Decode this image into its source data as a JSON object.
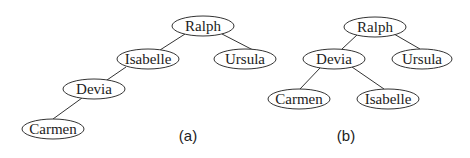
{
  "figure": {
    "trees": [
      {
        "caption": "(a)",
        "nodes": [
          {
            "id": "ralph",
            "label": "Ralph"
          },
          {
            "id": "isabelle",
            "label": "Isabelle"
          },
          {
            "id": "ursula",
            "label": "Ursula"
          },
          {
            "id": "devia",
            "label": "Devia"
          },
          {
            "id": "carmen",
            "label": "Carmen"
          }
        ],
        "edges": [
          [
            "Ralph",
            "Isabelle"
          ],
          [
            "Ralph",
            "Ursula"
          ],
          [
            "Isabelle",
            "Devia"
          ],
          [
            "Devia",
            "Carmen"
          ]
        ]
      },
      {
        "caption": "(b)",
        "nodes": [
          {
            "id": "ralph",
            "label": "Ralph"
          },
          {
            "id": "devia",
            "label": "Devia"
          },
          {
            "id": "ursula",
            "label": "Ursula"
          },
          {
            "id": "carmen",
            "label": "Carmen"
          },
          {
            "id": "isabelle",
            "label": "Isabelle"
          }
        ],
        "edges": [
          [
            "Ralph",
            "Devia"
          ],
          [
            "Ralph",
            "Ursula"
          ],
          [
            "Devia",
            "Carmen"
          ],
          [
            "Devia",
            "Isabelle"
          ]
        ]
      }
    ]
  }
}
